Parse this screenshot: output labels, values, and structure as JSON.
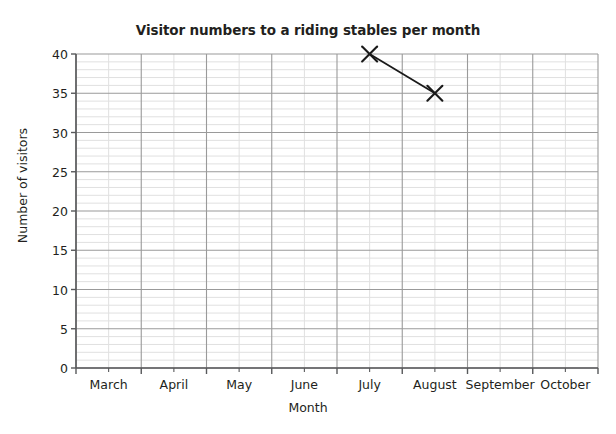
{
  "chart_data": {
    "type": "line",
    "title": "Visitor numbers to a riding stables per month",
    "xlabel": "Month",
    "ylabel": "Number of visitors",
    "categories": [
      "March",
      "April",
      "May",
      "June",
      "July",
      "August",
      "September",
      "October"
    ],
    "x_tick_labels": [
      "March",
      "April",
      "May",
      "June",
      "July",
      "August",
      "September",
      "October"
    ],
    "y_tick_labels": [
      "0",
      "5",
      "10",
      "15",
      "20",
      "25",
      "30",
      "35",
      "40"
    ],
    "y_ticks": [
      0,
      5,
      10,
      15,
      20,
      25,
      30,
      35,
      40
    ],
    "ylim": [
      0,
      40
    ],
    "y_major_step": 5,
    "y_minor_step": 1,
    "x_minor_divisions": 2,
    "grid": true,
    "legend": false,
    "marker": "x",
    "series": [
      {
        "name": "Visitors",
        "points": [
          {
            "category": "July",
            "value": 40
          },
          {
            "category": "August",
            "value": 35
          }
        ],
        "values": [
          null,
          null,
          null,
          null,
          40,
          35,
          null,
          null
        ],
        "color": "#1a1a1a"
      }
    ],
    "colors": {
      "line": "#1a1a1a",
      "marker": "#1a1a1a",
      "major_grid": "#9a9a9a",
      "minor_grid": "#e0e0e0",
      "axis": "#58595b",
      "text": "#231f20",
      "background": "#ffffff"
    }
  }
}
